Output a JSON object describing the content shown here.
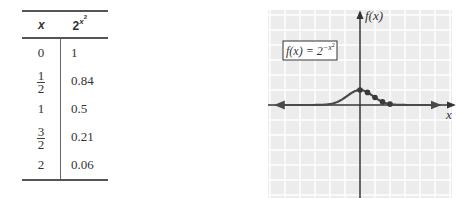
{
  "table": {
    "headers": {
      "x": "x",
      "fx_base": "2",
      "fx_exp_var": "x",
      "fx_exp_pow": "2"
    },
    "rows": [
      {
        "x": "0",
        "x_frac": null,
        "fx": "1"
      },
      {
        "x": null,
        "x_frac": {
          "num": "1",
          "den": "2"
        },
        "fx": "0.84"
      },
      {
        "x": "1",
        "x_frac": null,
        "fx": "0.5"
      },
      {
        "x": null,
        "x_frac": {
          "num": "3",
          "den": "2"
        },
        "fx": "0.21"
      },
      {
        "x": "2",
        "x_frac": null,
        "fx": "0.06"
      }
    ]
  },
  "chart_data": {
    "type": "line",
    "title": "",
    "function_label": "f(x) = 2^{-x^2}",
    "label_parts": {
      "lhs": "f(x) = 2",
      "exp": "−x",
      "exp_pow": "2"
    },
    "xlabel": "x",
    "ylabel": "f(x)",
    "xlim": [
      -6,
      6
    ],
    "ylim": [
      -6,
      6.3
    ],
    "grid": true,
    "colors": {
      "grid_bg": "#ececec",
      "grid_line": "#ffffff",
      "axis": "#333333",
      "curve": "#4a4a4a",
      "point": "#3a3a3a"
    },
    "series": [
      {
        "name": "f(x) = 2^{-x^2}",
        "curve_domain": [
          -5.6,
          5.3
        ],
        "points": [
          {
            "x": 0,
            "y": 1
          },
          {
            "x": 0.5,
            "y": 0.84
          },
          {
            "x": 1,
            "y": 0.5
          },
          {
            "x": 1.5,
            "y": 0.21
          },
          {
            "x": 2,
            "y": 0.06
          }
        ]
      }
    ]
  }
}
